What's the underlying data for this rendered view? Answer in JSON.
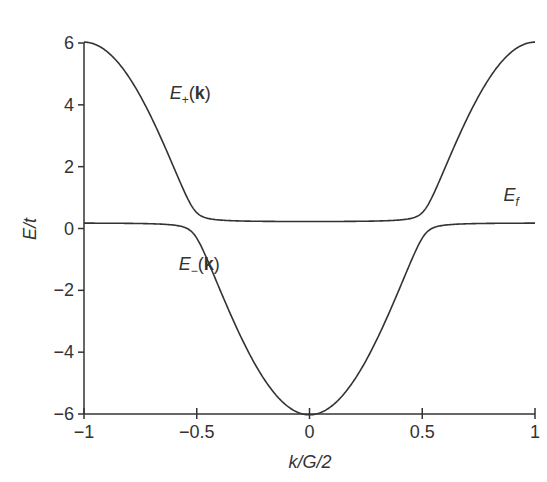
{
  "chart_data": {
    "type": "line",
    "title": "",
    "xlabel": "k/G/2",
    "ylabel": "E/t",
    "xlim": [
      -1,
      1
    ],
    "ylim": [
      -6,
      6
    ],
    "xticks": [
      -1,
      -0.5,
      0,
      0.5,
      1
    ],
    "xtick_labels": [
      "−1",
      "−0.5",
      "0",
      "0.5",
      "1"
    ],
    "yticks": [
      -6,
      -4,
      -2,
      0,
      2,
      4,
      6
    ],
    "ytick_labels": [
      "−6",
      "−4",
      "−2",
      "0",
      "2",
      "4",
      "6"
    ],
    "grid": false,
    "legend": "none (inline curve labels)",
    "annotations": [
      {
        "text_main": "E",
        "text_sub": "+",
        "text_tail": "(",
        "text_bold": "k",
        "text_end": ")",
        "x": -0.62,
        "y": 4.2,
        "name": "E-plus-label"
      },
      {
        "text_main": "E",
        "text_sub": "−",
        "text_tail": "(",
        "text_bold": "k",
        "text_end": ")",
        "x": -0.58,
        "y": -1.35,
        "name": "E-minus-label"
      },
      {
        "text_main": "E",
        "text_sub": "f",
        "text_tail": "",
        "text_bold": "",
        "text_end": "",
        "x": 0.86,
        "y": 0.9,
        "name": "E-f-label"
      }
    ],
    "model": {
      "epsilon_k": "-6 cos(pi k)",
      "E_f": 0.2,
      "V": 0.4
    },
    "x": [
      -1.0,
      -0.9,
      -0.8,
      -0.7,
      -0.6,
      -0.55,
      -0.5,
      -0.45,
      -0.4,
      -0.3,
      -0.2,
      -0.1,
      0.0,
      0.1,
      0.2,
      0.3,
      0.4,
      0.45,
      0.5,
      0.55,
      0.6,
      0.7,
      0.8,
      0.9,
      1.0
    ],
    "series": [
      {
        "name": "E+(k)",
        "values": [
          6.03,
          5.73,
          4.88,
          3.56,
          1.94,
          1.17,
          0.51,
          0.31,
          0.27,
          0.24,
          0.23,
          0.23,
          0.23,
          0.23,
          0.23,
          0.24,
          0.27,
          0.31,
          0.51,
          1.17,
          1.94,
          3.56,
          4.88,
          5.73,
          6.03
        ]
      },
      {
        "name": "E−(k)",
        "values": [
          0.17,
          0.17,
          0.16,
          0.15,
          0.12,
          0.08,
          -0.31,
          -0.95,
          -1.71,
          -3.36,
          -4.81,
          -5.72,
          -6.03,
          -5.72,
          -4.81,
          -3.36,
          -1.71,
          -0.95,
          -0.31,
          0.08,
          0.12,
          0.15,
          0.16,
          0.17,
          0.17
        ]
      }
    ],
    "plot_area_px": {
      "x0": 84,
      "x1": 535,
      "y_top": 43,
      "y_bottom": 414
    },
    "line_color": "#333333"
  }
}
